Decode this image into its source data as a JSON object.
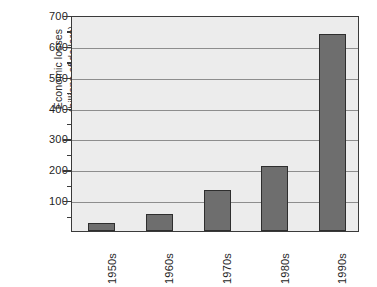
{
  "chart_data": {
    "type": "bar",
    "title": "",
    "subtitle": "",
    "xlabel": "",
    "ylabel": "Economic losses (billions of dollars)",
    "ylabel_lines": [
      "Economic losses",
      "(billions of dollars)"
    ],
    "categories": [
      "1950s",
      "1960s",
      "1970s",
      "1980s",
      "1990s"
    ],
    "values": [
      26,
      56,
      132,
      210,
      640
    ],
    "ylim": [
      0,
      700
    ],
    "y_ticks": [
      100,
      200,
      300,
      400,
      500,
      600,
      700
    ],
    "y_tick_labels": [
      "100",
      "200",
      "300",
      "400",
      "500",
      "600",
      "700"
    ],
    "y_minor_ticks": [
      50,
      150,
      250,
      350,
      450,
      550,
      650
    ],
    "grid": true,
    "grid_axis": "y",
    "legend": false,
    "legend_position": "none",
    "bar_color": "#6e6e6e",
    "bar_edge_color": "#2e2e2e",
    "plot_background": "#ececec",
    "frame_color": "#3a3a3a",
    "gridline_color": "#8d8d8d",
    "text_color": "#1f1f1f",
    "x_tick_label_rotation": 90
  }
}
